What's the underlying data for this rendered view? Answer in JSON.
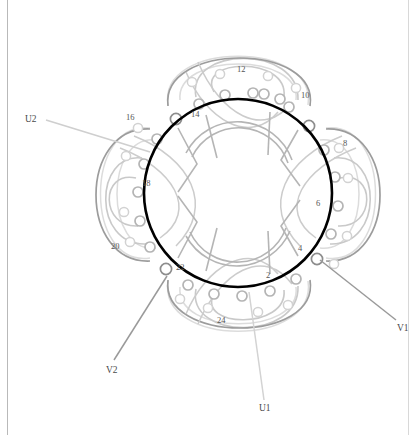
{
  "figure": {
    "type": "motor-stator-winding-diagram",
    "title": "",
    "slot_count": 24,
    "background_color": "#ffffff",
    "stator_bore_color": "#000000",
    "stator_bore": {
      "cx": 238,
      "cy": 193,
      "r": 94,
      "stroke_width": 2.6
    },
    "inner_bore": {
      "cx": 238,
      "cy": 193,
      "r": 52
    },
    "node_ring": {
      "cx": 238,
      "cy": 193,
      "r": 104,
      "node_r": 5.2
    },
    "phase_colors": {
      "U": "#bdbdbd",
      "V": "#a8a8a8",
      "W": "#8f8f8f",
      "faint": "#d7d7d7",
      "mid": "#c4c4c4",
      "dark": "#909090"
    }
  },
  "slot_labels": [
    {
      "text": "2",
      "x": 266,
      "y": 271
    },
    {
      "text": "4",
      "x": 298,
      "y": 244
    },
    {
      "text": "6",
      "x": 316,
      "y": 199
    },
    {
      "text": "8",
      "x": 343,
      "y": 139
    },
    {
      "text": "10",
      "x": 301,
      "y": 91
    },
    {
      "text": "12",
      "x": 237,
      "y": 65
    },
    {
      "text": "14",
      "x": 191,
      "y": 110
    },
    {
      "text": "16",
      "x": 126,
      "y": 113
    },
    {
      "text": "18",
      "x": 142,
      "y": 179
    },
    {
      "text": "20",
      "x": 111,
      "y": 242
    },
    {
      "text": "22",
      "x": 176,
      "y": 263
    },
    {
      "text": "24",
      "x": 217,
      "y": 316
    }
  ],
  "terminal_labels": [
    {
      "name": "U1",
      "text": "U1",
      "x": 259,
      "y": 404,
      "color": "#4a4a4a"
    },
    {
      "name": "U2",
      "text": "U2",
      "x": 25,
      "y": 115,
      "color": "#4a4a4a"
    },
    {
      "name": "V1",
      "text": "V1",
      "x": 397,
      "y": 324,
      "color": "#4a4a4a"
    },
    {
      "name": "V2",
      "text": "V2",
      "x": 106,
      "y": 366,
      "color": "#4a4a4a"
    }
  ],
  "leader_lines": [
    {
      "name": "u1-leader",
      "x1": 264,
      "y1": 400,
      "x2": 249,
      "y2": 290,
      "color": "#d0d0d0"
    },
    {
      "name": "u2-leader",
      "x1": 46,
      "y1": 120,
      "x2": 150,
      "y2": 150,
      "color": "#cfcfcf"
    },
    {
      "name": "v1-leader",
      "x1": 397,
      "y1": 320,
      "x2": 322,
      "y2": 260,
      "color": "#9a9a9a"
    },
    {
      "name": "v2-leader",
      "x1": 113,
      "y1": 360,
      "x2": 166,
      "y2": 278,
      "color": "#9a9a9a"
    }
  ],
  "legend": {
    "visible": false,
    "entries": []
  }
}
